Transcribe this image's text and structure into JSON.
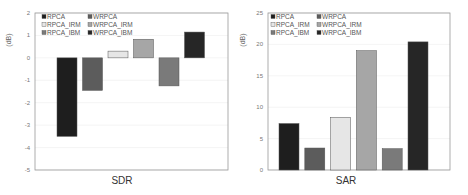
{
  "legend": {
    "items": [
      {
        "label": "RPCA",
        "color": "#1e1e1e"
      },
      {
        "label": "WRPCA",
        "color": "#5c5c5c"
      },
      {
        "label": "RPCA_IRM",
        "color": "#e6e6e6"
      },
      {
        "label": "WRPCA_IRM",
        "color": "#a6a6a6"
      },
      {
        "label": "RPCA_IBM",
        "color": "#7a7a7a"
      },
      {
        "label": "WRPCA_IBM",
        "color": "#262626"
      }
    ]
  },
  "chart_data": [
    {
      "type": "bar",
      "title": "",
      "xlabel": "SDR",
      "ylabel": "(dB)",
      "ylim": [
        -5,
        2
      ],
      "yticks": [
        "2",
        "1",
        "0",
        "-1",
        "-2",
        "-3",
        "-4",
        "-5"
      ],
      "grid": true,
      "legend_position": "upper left",
      "categories": [
        "SDR"
      ],
      "series": [
        {
          "name": "RPCA",
          "values": [
            -3.5
          ]
        },
        {
          "name": "WRPCA",
          "values": [
            -1.45
          ]
        },
        {
          "name": "RPCA_IRM",
          "values": [
            0.3
          ]
        },
        {
          "name": "WRPCA_IRM",
          "values": [
            0.83
          ]
        },
        {
          "name": "RPCA_IBM",
          "values": [
            -1.25
          ]
        },
        {
          "name": "WRPCA_IBM",
          "values": [
            1.15
          ]
        }
      ]
    },
    {
      "type": "bar",
      "title": "",
      "xlabel": "SAR",
      "ylabel": "(dB)",
      "ylim": [
        0,
        25
      ],
      "yticks": [
        "25",
        "20",
        "15",
        "10",
        "5",
        "0"
      ],
      "grid": true,
      "legend_position": "upper left",
      "categories": [
        "SAR"
      ],
      "series": [
        {
          "name": "RPCA",
          "values": [
            7.4
          ]
        },
        {
          "name": "WRPCA",
          "values": [
            3.5
          ]
        },
        {
          "name": "RPCA_IRM",
          "values": [
            8.4
          ]
        },
        {
          "name": "WRPCA_IRM",
          "values": [
            19.0
          ]
        },
        {
          "name": "RPCA_IBM",
          "values": [
            3.4
          ]
        },
        {
          "name": "WRPCA_IBM",
          "values": [
            20.4
          ]
        }
      ]
    }
  ]
}
